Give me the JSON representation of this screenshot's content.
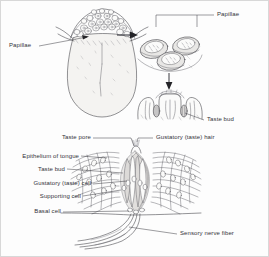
{
  "figure": {
    "background_color": "#fdfdfd",
    "ink_color": "#3a3a40",
    "label_color": "#33323a"
  },
  "panels": {
    "tongue": {
      "name": "Dorsal view of tongue with papillae"
    },
    "papillae_closeup": {
      "name": "Enlarged circumvallate papillae"
    },
    "papilla_section": {
      "name": "Sectioned papilla showing taste buds"
    },
    "taste_bud_detail": {
      "name": "Taste bud cellular detail"
    }
  },
  "labels": {
    "papillae_left": "Papillae",
    "papillae_right": "Papillae",
    "taste_bud_upper": "Taste bud",
    "taste_pore": "Taste pore",
    "gustatory_hair": "Gustatory (taste) hair",
    "epithelium": "Epithelium of tongue",
    "taste_bud_lower": "Taste bud",
    "gustatory_cell": "Gustatory (taste) cell",
    "supporting_cell": "Supporting cell",
    "basal_cell": "Basal cell",
    "sensory_nerve_fiber": "Sensory nerve fiber"
  }
}
